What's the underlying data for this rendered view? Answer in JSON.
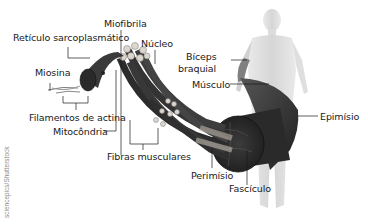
{
  "diagram": {
    "labels": {
      "miofibrila": "Miofibrila",
      "reticulo": "Retículo sarcoplasmático",
      "nucleo": "Núcleo",
      "miosina": "Miosina",
      "filamentos": "Filamentos de actina",
      "mitocondria": "Mitocôndria",
      "fibras": "Fibras musculares",
      "biceps_1": "Bíceps",
      "biceps_2": "braquial",
      "musculo": "Músculo",
      "epimisio": "Epimísio",
      "perimisio": "Perimísio",
      "fasciculo": "Fascículo"
    },
    "credit": "sciencepics/Shutterstock",
    "colors": {
      "muscle_dark": "#2e2e2e",
      "muscle_mid": "#4a4a4a",
      "fiber_tip": "#d9d4cc",
      "body_silhouette": "#d8d8d8",
      "leader_line": "#1a1a1a"
    }
  }
}
